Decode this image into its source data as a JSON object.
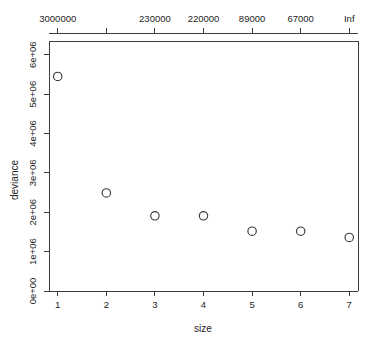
{
  "chart_data": {
    "type": "scatter",
    "title": "",
    "xlabel": "size",
    "ylabel": "deviance",
    "x": [
      1,
      2,
      3,
      4,
      5,
      6,
      7
    ],
    "values": [
      5450000,
      2490000,
      1910000,
      1910000,
      1520000,
      1520000,
      1360000
    ],
    "series": [
      {
        "name": "deviance",
        "values": [
          5450000,
          2490000,
          1910000,
          1910000,
          1520000,
          1520000,
          1360000
        ]
      }
    ],
    "xlim": [
      0.82,
      7.18
    ],
    "ylim": [
      0,
      6350000
    ],
    "xticks": [
      1,
      2,
      3,
      4,
      5,
      6,
      7
    ],
    "xticklabels": [
      "1",
      "2",
      "3",
      "4",
      "5",
      "6",
      "7"
    ],
    "yticks": [
      0,
      1000000,
      2000000,
      3000000,
      4000000,
      5000000,
      6000000
    ],
    "yticklabels": [
      "0e+00",
      "1e+06",
      "2e+06",
      "3e+06",
      "4e+06",
      "5e+06",
      "6e+06"
    ],
    "top_axis": {
      "label": "",
      "ticks": [
        1,
        2,
        3,
        4,
        5,
        6,
        7
      ],
      "ticklabels": [
        "3000000",
        "",
        "230000",
        "220000",
        "89000",
        "67000",
        "Inf"
      ]
    },
    "grid": false,
    "legend": null,
    "marker": "open-circle",
    "marker_color": "#3a3a3a",
    "background": "#ffffff"
  }
}
